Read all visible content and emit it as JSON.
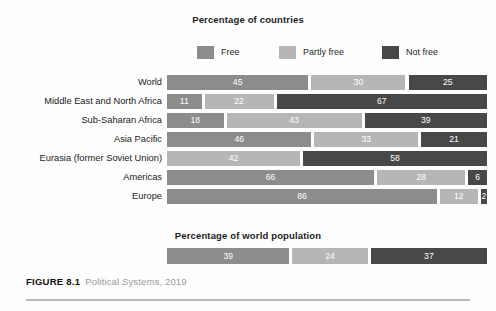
{
  "figure": {
    "number_label": "FIGURE 8.1",
    "caption": "Political Systems, 2019"
  },
  "colors": {
    "free": "#8c8c8c",
    "partly_free": "#b6b6b6",
    "not_free": "#484848",
    "background": "#fefefe",
    "value_text": "#ffffff",
    "rule": "#b9b9b9"
  },
  "legend": {
    "items": [
      {
        "label": "Free",
        "color_key": "free"
      },
      {
        "label": "Partly free",
        "color_key": "partly_free"
      },
      {
        "label": "Not free",
        "color_key": "not_free"
      }
    ]
  },
  "chart_data": {
    "type": "bar",
    "orientation": "horizontal",
    "stacked": true,
    "title": "Percentage of countries",
    "subtitle": "Percentage of world population",
    "xlabel": "",
    "ylabel": "",
    "xlim": [
      0,
      100
    ],
    "grid": false,
    "legend_position": "top",
    "units": "percent",
    "series": [
      {
        "name": "Free",
        "values": [
          45,
          11,
          18,
          46,
          0,
          66,
          86
        ]
      },
      {
        "name": "Partly free",
        "values": [
          30,
          22,
          43,
          33,
          42,
          28,
          12
        ]
      },
      {
        "name": "Not free",
        "values": [
          25,
          67,
          39,
          21,
          58,
          6,
          2
        ]
      }
    ],
    "categories": [
      "World",
      "Middle East and North Africa",
      "Sub-Saharan Africa",
      "Asia Pacific",
      "Eurasia (former Soviet Union)",
      "Americas",
      "Europe"
    ],
    "world_population": {
      "title": "Percentage of world population",
      "categories": [
        "World population"
      ],
      "series": [
        {
          "name": "Free",
          "values": [
            39
          ]
        },
        {
          "name": "Partly free",
          "values": [
            24
          ]
        },
        {
          "name": "Not free",
          "values": [
            37
          ]
        }
      ]
    }
  },
  "rows": [
    {
      "label": "World",
      "segments": [
        {
          "series": "Free",
          "value": 45,
          "value_label": "45",
          "color_key": "free"
        },
        {
          "series": "Partly free",
          "value": 30,
          "value_label": "30",
          "color_key": "partly_free"
        },
        {
          "series": "Not free",
          "value": 25,
          "value_label": "25",
          "color_key": "not_free"
        }
      ]
    },
    {
      "label": "Middle East and North Africa",
      "segments": [
        {
          "series": "Free",
          "value": 11,
          "value_label": "11",
          "color_key": "free"
        },
        {
          "series": "Partly free",
          "value": 22,
          "value_label": "22",
          "color_key": "partly_free"
        },
        {
          "series": "Not free",
          "value": 67,
          "value_label": "67",
          "color_key": "not_free"
        }
      ]
    },
    {
      "label": "Sub-Saharan Africa",
      "segments": [
        {
          "series": "Free",
          "value": 18,
          "value_label": "18",
          "color_key": "free"
        },
        {
          "series": "Partly free",
          "value": 43,
          "value_label": "43",
          "color_key": "partly_free"
        },
        {
          "series": "Not free",
          "value": 39,
          "value_label": "39",
          "color_key": "not_free"
        }
      ]
    },
    {
      "label": "Asia Pacific",
      "segments": [
        {
          "series": "Free",
          "value": 46,
          "value_label": "46",
          "color_key": "free"
        },
        {
          "series": "Partly free",
          "value": 33,
          "value_label": "33",
          "color_key": "partly_free"
        },
        {
          "series": "Not free",
          "value": 21,
          "value_label": "21",
          "color_key": "not_free"
        }
      ]
    },
    {
      "label": "Eurasia (former Soviet Union)",
      "segments": [
        {
          "series": "Partly free",
          "value": 42,
          "value_label": "42",
          "color_key": "partly_free"
        },
        {
          "series": "Not free",
          "value": 58,
          "value_label": "58",
          "color_key": "not_free"
        }
      ]
    },
    {
      "label": "Americas",
      "segments": [
        {
          "series": "Free",
          "value": 66,
          "value_label": "66",
          "color_key": "free"
        },
        {
          "series": "Partly free",
          "value": 28,
          "value_label": "28",
          "color_key": "partly_free"
        },
        {
          "series": "Not free",
          "value": 6,
          "value_label": "6",
          "color_key": "not_free"
        }
      ]
    },
    {
      "label": "Europe",
      "segments": [
        {
          "series": "Free",
          "value": 86,
          "value_label": "86",
          "color_key": "free"
        },
        {
          "series": "Partly free",
          "value": 12,
          "value_label": "12",
          "color_key": "partly_free"
        },
        {
          "series": "Not free",
          "value": 2,
          "value_label": "2",
          "color_key": "not_free"
        }
      ]
    }
  ],
  "population_row": {
    "label": "",
    "segments": [
      {
        "series": "Free",
        "value": 39,
        "value_label": "39",
        "color_key": "free"
      },
      {
        "series": "Partly free",
        "value": 24,
        "value_label": "24",
        "color_key": "partly_free"
      },
      {
        "series": "Not free",
        "value": 37,
        "value_label": "37",
        "color_key": "not_free"
      }
    ]
  }
}
